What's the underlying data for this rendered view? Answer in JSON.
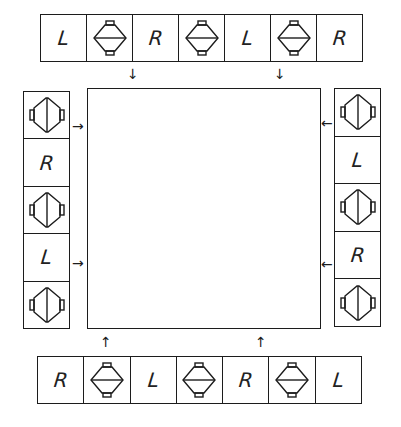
{
  "diagram": {
    "strips": {
      "top": {
        "direction": "down",
        "cells": [
          {
            "type": "letter",
            "label": "L"
          },
          {
            "type": "icon",
            "icon": "lantern-horizontal-icon"
          },
          {
            "type": "letter",
            "label": "R"
          },
          {
            "type": "icon",
            "icon": "lantern-horizontal-icon"
          },
          {
            "type": "letter",
            "label": "L"
          },
          {
            "type": "icon",
            "icon": "lantern-horizontal-icon"
          },
          {
            "type": "letter",
            "label": "R"
          }
        ],
        "arrows": [
          "↓",
          "↓"
        ]
      },
      "left": {
        "direction": "right",
        "cells": [
          {
            "type": "icon",
            "icon": "lantern-vertical-icon"
          },
          {
            "type": "letter",
            "label": "R"
          },
          {
            "type": "icon",
            "icon": "lantern-vertical-icon"
          },
          {
            "type": "letter",
            "label": "L"
          },
          {
            "type": "icon",
            "icon": "lantern-vertical-icon"
          }
        ],
        "arrows": [
          "→",
          "→"
        ]
      },
      "right": {
        "direction": "left",
        "cells": [
          {
            "type": "icon",
            "icon": "lantern-vertical-icon"
          },
          {
            "type": "letter",
            "label": "L"
          },
          {
            "type": "icon",
            "icon": "lantern-vertical-icon"
          },
          {
            "type": "letter",
            "label": "R"
          },
          {
            "type": "icon",
            "icon": "lantern-vertical-icon"
          }
        ],
        "arrows": [
          "←",
          "←"
        ]
      },
      "bottom": {
        "direction": "up",
        "cells": [
          {
            "type": "letter",
            "label": "R"
          },
          {
            "type": "icon",
            "icon": "lantern-horizontal-icon"
          },
          {
            "type": "letter",
            "label": "L"
          },
          {
            "type": "icon",
            "icon": "lantern-horizontal-icon"
          },
          {
            "type": "letter",
            "label": "R"
          },
          {
            "type": "icon",
            "icon": "lantern-horizontal-icon"
          },
          {
            "type": "letter",
            "label": "L"
          }
        ],
        "arrows": [
          "↑",
          "↑"
        ]
      }
    }
  }
}
